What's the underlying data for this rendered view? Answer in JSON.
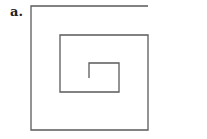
{
  "figure": {
    "label": "a.",
    "stroke_color": "#5a5a5a",
    "stroke_width": 1.3,
    "spiral_path": [
      [
        148,
        6
      ],
      [
        31,
        6
      ],
      [
        31,
        130
      ],
      [
        148,
        130
      ],
      [
        148,
        35
      ],
      [
        60,
        35
      ],
      [
        60,
        92
      ],
      [
        119,
        92
      ],
      [
        119,
        63
      ],
      [
        89,
        63
      ],
      [
        89,
        78
      ]
    ]
  }
}
